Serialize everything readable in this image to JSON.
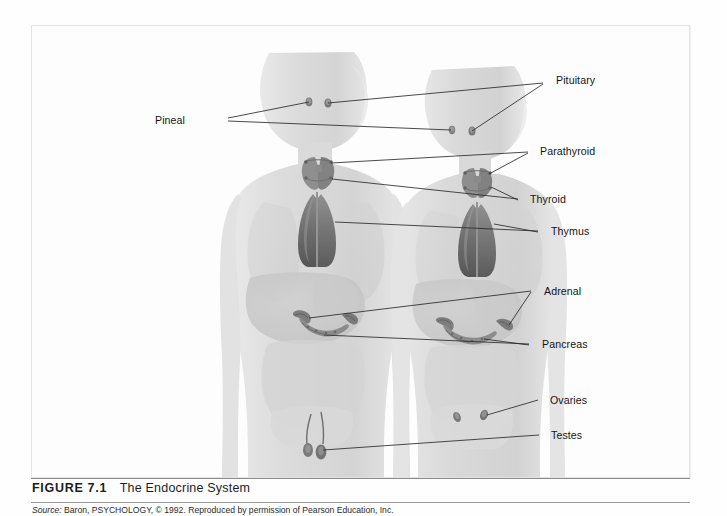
{
  "figure": {
    "number_label": "FIGURE 7.1",
    "title": "The Endocrine System",
    "source_label": "Source:",
    "source_text": "Baron, PSYCHOLOGY, © 1992. Reproduced by permission of Pearson Education, Inc."
  },
  "diagram": {
    "subjects": [
      {
        "name": "male-figure",
        "side": "left"
      },
      {
        "name": "female-figure",
        "side": "right"
      }
    ],
    "labels": [
      {
        "id": "pituitary",
        "text": "Pituitary",
        "x": 524,
        "y": 55,
        "align": "left"
      },
      {
        "id": "pineal",
        "text": "Pineal",
        "x": 153,
        "y": 95,
        "align": "left"
      },
      {
        "id": "parathyroid",
        "text": "Parathyroid",
        "x": 508,
        "y": 126,
        "align": "left"
      },
      {
        "id": "thyroid",
        "text": "Thyroid",
        "x": 498,
        "y": 174,
        "align": "left"
      },
      {
        "id": "thymus",
        "text": "Thymus",
        "x": 519,
        "y": 206,
        "align": "left"
      },
      {
        "id": "adrenal",
        "text": "Adrenal",
        "x": 512,
        "y": 266,
        "align": "left"
      },
      {
        "id": "pancreas",
        "text": "Pancreas",
        "x": 510,
        "y": 319,
        "align": "left"
      },
      {
        "id": "ovaries",
        "text": "Ovaries",
        "x": 518,
        "y": 375,
        "align": "left"
      },
      {
        "id": "testes",
        "text": "Testes",
        "x": 519,
        "y": 410,
        "align": "left"
      }
    ],
    "colors": {
      "body_silhouette": "#dcdcdc",
      "organ_shadow": "#c6c6c6",
      "thymus_dark": "#6d6d6d",
      "leader_line": "#2b2b2b",
      "frame_border": "#e3e3e3",
      "caption_rule": "#8c8c8c"
    }
  }
}
